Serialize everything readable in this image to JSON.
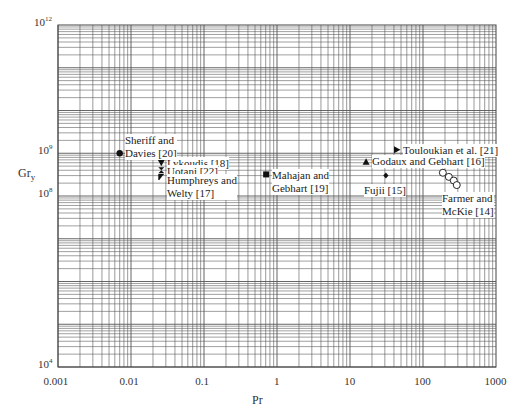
{
  "chart_data": {
    "type": "scatter",
    "title": "",
    "xlabel": "Pr",
    "ylabel": "Gr_y",
    "xscale": "log",
    "yscale": "log",
    "xlim": [
      0.001,
      1000
    ],
    "ylim": [
      10000,
      1000000000000
    ],
    "grid": true,
    "x_ticks": [
      "0.001",
      "0.01",
      "0.1",
      "1",
      "10",
      "100",
      "1000"
    ],
    "y_ticks": [
      {
        "base": "10",
        "exp": "4"
      },
      {
        "base": "10",
        "exp": "8"
      },
      {
        "base": "10",
        "exp": "9"
      },
      {
        "base": "10",
        "exp": "12"
      }
    ],
    "series": [
      {
        "name": "Sheriff and Davies [20]",
        "marker": "circle-filled",
        "points": [
          [
            0.007,
            1000000000.0
          ]
        ]
      },
      {
        "name": "Lykoudis [18]",
        "marker": "triangle-down-filled",
        "points": [
          [
            0.026,
            600000000.0
          ]
        ]
      },
      {
        "name": "Uotani [22]",
        "marker": "hourglass",
        "points": [
          [
            0.026,
            400000000.0
          ]
        ]
      },
      {
        "name": "Humphreys and Welty [17]",
        "marker": "flag",
        "points": [
          [
            0.026,
            280000000.0
          ]
        ]
      },
      {
        "name": "Mahajan and Gebhart [19]",
        "marker": "square-filled",
        "points": [
          [
            0.71,
            320000000.0
          ]
        ]
      },
      {
        "name": "Godaux and Gebhart [16]",
        "marker": "triangle-up-filled",
        "points": [
          [
            16.6,
            630000000.0
          ]
        ]
      },
      {
        "name": "Fujii [15]",
        "marker": "diamond-filled",
        "points": [
          [
            31,
            300000000.0
          ]
        ]
      },
      {
        "name": "Touloukian et al. [21]",
        "marker": "triangle-right-filled",
        "points": [
          [
            44,
            1200000000.0
          ]
        ]
      },
      {
        "name": "Farmer and McKie [14]",
        "marker": "circle-open",
        "points": [
          [
            187,
            350000000.0
          ],
          [
            226,
            280000000.0
          ],
          [
            264,
            230000000.0
          ],
          [
            290,
            180000000.0
          ]
        ]
      }
    ],
    "annotations": [
      {
        "lines": [
          "Sheriff and",
          "Davies [20]"
        ]
      },
      {
        "lines": [
          "Lykoudis [18]"
        ]
      },
      {
        "lines": [
          "Uotani [22]"
        ]
      },
      {
        "lines": [
          "Humphreys and",
          "Welty [17]"
        ]
      },
      {
        "lines": [
          "Mahajan and",
          "Gebhart [19]"
        ]
      },
      {
        "lines": [
          "Godaux and Gebhart [16]"
        ]
      },
      {
        "lines": [
          "Fujii [15]"
        ]
      },
      {
        "lines": [
          "Touloukian et al. [21]"
        ]
      },
      {
        "lines": [
          "Farmer and",
          "McKie [14]"
        ]
      }
    ]
  },
  "colors": {
    "grid": "#555555",
    "marker": "#111111",
    "text": "#222222",
    "background": "#ffffff"
  }
}
